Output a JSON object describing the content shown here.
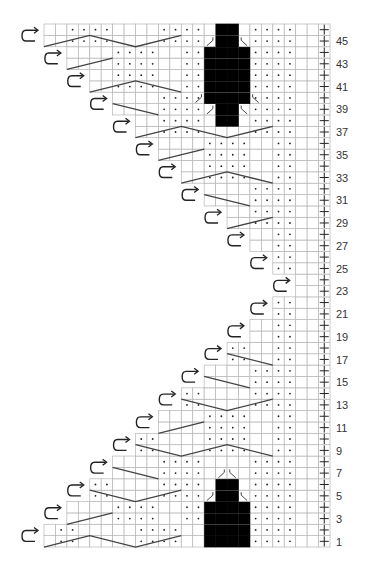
{
  "grid": {
    "x0": 44,
    "y0": 24,
    "cell_w": 11.44,
    "cell_h": 11.37,
    "cols": 25,
    "rows": 46,
    "grid_color": "#b5b5b5",
    "line_color": "#444444",
    "fill_color": "#000000"
  },
  "legend_symbols": {
    "dot": "purl stitch",
    "plus_column": "edge stitch",
    "turn_arrow": "turn (short row)",
    "black": "no stitch",
    "diagonal_line": "cable / crossing line",
    "y_symbol": "increase"
  },
  "row_labels": [
    "1",
    "3",
    "5",
    "7",
    "9",
    "11",
    "13",
    "15",
    "17",
    "19",
    "21",
    "23",
    "25",
    "27",
    "29",
    "31",
    "33",
    "35",
    "37",
    "39",
    "41",
    "43",
    "45"
  ],
  "rows": [
    {
      "n": 1,
      "start": 0,
      "dots": [
        1,
        2,
        8,
        9,
        10,
        11,
        15,
        16,
        18,
        19,
        20,
        21
      ],
      "black": [
        14,
        15,
        16,
        17
      ],
      "line": [
        [
          0,
          1
        ],
        [
          4,
          0
        ],
        [
          8,
          1
        ],
        [
          12,
          0
        ]
      ]
    },
    {
      "n": 2,
      "start": 0,
      "dots": [
        1,
        2,
        8,
        9,
        10,
        11,
        15,
        16,
        18,
        19,
        20,
        21
      ],
      "black": [
        14,
        15,
        16,
        17
      ]
    },
    {
      "n": 3,
      "start": 2,
      "dots": [
        6,
        7,
        8,
        9,
        12,
        13,
        18,
        19,
        20,
        21
      ],
      "black": [
        14,
        15,
        16,
        17
      ],
      "line": [
        [
          2,
          1
        ],
        [
          6,
          0
        ]
      ]
    },
    {
      "n": 4,
      "start": 2,
      "dots": [
        6,
        7,
        8,
        9,
        12,
        13,
        18,
        19,
        20,
        21
      ],
      "black": [
        14,
        15,
        16,
        17
      ]
    },
    {
      "n": 5,
      "start": 4,
      "dots": [
        4,
        5,
        10,
        11,
        12,
        13,
        18,
        19,
        20,
        21
      ],
      "black": [
        15,
        16
      ],
      "y": [
        14,
        17
      ],
      "line": [
        [
          4,
          0
        ],
        [
          8,
          1
        ],
        [
          12,
          0
        ]
      ]
    },
    {
      "n": 6,
      "start": 4,
      "dots": [
        4,
        5,
        10,
        11,
        12,
        13,
        18,
        19,
        20,
        21
      ],
      "black": [
        15,
        16
      ]
    },
    {
      "n": 7,
      "start": 6,
      "dots": [
        10,
        11,
        12,
        13,
        18,
        19,
        20,
        21
      ],
      "y": [
        15,
        16
      ],
      "line": [
        [
          6,
          0
        ],
        [
          10,
          1
        ]
      ]
    },
    {
      "n": 8,
      "start": 6,
      "dots": [
        10,
        11,
        12,
        13,
        18,
        19,
        20,
        21
      ]
    },
    {
      "n": 9,
      "start": 8,
      "dots": [
        8,
        9,
        14,
        15,
        16,
        17,
        20,
        21
      ],
      "line": [
        [
          8,
          0
        ],
        [
          12,
          1
        ],
        [
          16,
          0
        ],
        [
          20,
          1
        ]
      ]
    },
    {
      "n": 10,
      "start": 8,
      "dots": [
        8,
        9,
        14,
        15,
        16,
        17,
        20,
        21
      ]
    },
    {
      "n": 11,
      "start": 10,
      "dots": [
        14,
        15,
        16,
        17,
        20,
        21
      ],
      "line": [
        [
          10,
          1
        ],
        [
          14,
          0
        ]
      ]
    },
    {
      "n": 12,
      "start": 10,
      "dots": [
        14,
        15,
        16,
        17,
        20,
        21
      ]
    },
    {
      "n": 13,
      "start": 12,
      "dots": [
        12,
        13,
        18,
        19,
        20,
        21
      ],
      "line": [
        [
          12,
          0
        ],
        [
          16,
          1
        ],
        [
          20,
          0
        ]
      ]
    },
    {
      "n": 14,
      "start": 12,
      "dots": [
        12,
        13,
        18,
        19,
        20,
        21
      ]
    },
    {
      "n": 15,
      "start": 14,
      "dots": [
        18,
        19,
        20,
        21
      ],
      "line": [
        [
          14,
          0
        ],
        [
          18,
          1
        ]
      ]
    },
    {
      "n": 16,
      "start": 14,
      "dots": [
        18,
        19,
        20,
        21
      ]
    },
    {
      "n": 17,
      "start": 16,
      "dots": [
        16,
        17,
        20,
        21
      ],
      "line": [
        [
          16,
          0
        ],
        [
          20,
          1
        ]
      ]
    },
    {
      "n": 18,
      "start": 16,
      "dots": [
        16,
        17,
        20,
        21
      ]
    },
    {
      "n": 19,
      "start": 18,
      "dots": [
        20,
        21
      ]
    },
    {
      "n": 20,
      "start": 18,
      "dots": [
        20,
        21
      ]
    },
    {
      "n": 21,
      "start": 20,
      "dots": [
        20,
        21
      ]
    },
    {
      "n": 22,
      "start": 20,
      "dots": [
        20,
        21
      ]
    },
    {
      "n": 23,
      "start": 22,
      "dots": []
    },
    {
      "n": 24,
      "start": 22,
      "dots": []
    },
    {
      "n": 25,
      "start": 20,
      "dots": [
        20,
        21
      ]
    },
    {
      "n": 26,
      "start": 20,
      "dots": [
        20,
        21
      ]
    },
    {
      "n": 27,
      "start": 18,
      "dots": [
        20,
        21
      ]
    },
    {
      "n": 28,
      "start": 18,
      "dots": [
        20,
        21
      ]
    },
    {
      "n": 29,
      "start": 16,
      "dots": [
        18,
        19,
        20,
        21
      ],
      "line": [
        [
          16,
          1
        ],
        [
          20,
          0
        ]
      ]
    },
    {
      "n": 30,
      "start": 16,
      "dots": [
        18,
        19,
        20,
        21
      ]
    },
    {
      "n": 31,
      "start": 14,
      "dots": [
        18,
        19,
        20,
        21
      ],
      "line": [
        [
          14,
          0
        ],
        [
          18,
          1
        ]
      ]
    },
    {
      "n": 32,
      "start": 14,
      "dots": [
        18,
        19,
        20,
        21
      ]
    },
    {
      "n": 33,
      "start": 12,
      "dots": [
        14,
        15,
        16,
        17,
        20,
        21
      ],
      "line": [
        [
          12,
          1
        ],
        [
          16,
          0
        ],
        [
          20,
          1
        ]
      ]
    },
    {
      "n": 34,
      "start": 12,
      "dots": [
        14,
        15,
        16,
        17,
        20,
        21
      ]
    },
    {
      "n": 35,
      "start": 10,
      "dots": [
        14,
        15,
        16,
        17,
        20,
        21
      ],
      "line": [
        [
          10,
          1
        ],
        [
          14,
          0
        ]
      ]
    },
    {
      "n": 36,
      "start": 10,
      "dots": [
        14,
        15,
        16,
        17,
        20,
        21
      ]
    },
    {
      "n": 37,
      "start": 8,
      "dots": [
        10,
        11,
        12,
        13,
        18,
        19,
        20,
        21
      ],
      "line": [
        [
          8,
          1
        ],
        [
          12,
          0
        ],
        [
          16,
          1
        ],
        [
          20,
          0
        ]
      ]
    },
    {
      "n": 38,
      "start": 8,
      "dots": [
        10,
        11,
        12,
        13,
        18,
        19,
        20,
        21
      ],
      "black": [
        15,
        16
      ]
    },
    {
      "n": 39,
      "start": 6,
      "dots": [
        10,
        11,
        12,
        13,
        18,
        19,
        20,
        21
      ],
      "black": [
        15,
        16
      ],
      "y": [
        14,
        17
      ],
      "line": [
        [
          6,
          0
        ],
        [
          10,
          1
        ]
      ]
    },
    {
      "n": 40,
      "start": 6,
      "dots": [
        10,
        11,
        12,
        13,
        18,
        19,
        20,
        21
      ],
      "black": [
        14,
        15,
        16,
        17
      ],
      "y": [
        13,
        18
      ]
    },
    {
      "n": 41,
      "start": 4,
      "dots": [
        6,
        7,
        8,
        9,
        12,
        13,
        18,
        19,
        20,
        21
      ],
      "black": [
        14,
        15,
        16,
        17
      ],
      "line": [
        [
          4,
          1
        ],
        [
          8,
          0
        ],
        [
          12,
          1
        ]
      ]
    },
    {
      "n": 42,
      "start": 4,
      "dots": [
        6,
        7,
        8,
        9,
        12,
        13,
        18,
        19,
        20,
        21
      ],
      "black": [
        14,
        15,
        16,
        17
      ]
    },
    {
      "n": 43,
      "start": 2,
      "dots": [
        6,
        7,
        8,
        9,
        12,
        13,
        18,
        19,
        20,
        21
      ],
      "black": [
        14,
        15,
        16,
        17
      ],
      "line": [
        [
          2,
          1
        ],
        [
          6,
          0
        ]
      ]
    },
    {
      "n": 44,
      "start": 2,
      "dots": [
        6,
        7,
        8,
        9,
        12,
        13,
        18,
        19,
        20,
        21
      ],
      "black": [
        14,
        15,
        16,
        17
      ]
    },
    {
      "n": 45,
      "start": 0,
      "dots": [
        2,
        3,
        4,
        5,
        10,
        11,
        12,
        13,
        18,
        19,
        20,
        21
      ],
      "black": [
        15,
        16
      ],
      "y": [
        14,
        17
      ],
      "line": [
        [
          0,
          1
        ],
        [
          4,
          0
        ],
        [
          8,
          1
        ],
        [
          12,
          0
        ]
      ]
    },
    {
      "n": 46,
      "start": 0,
      "dots": [
        2,
        3,
        4,
        5,
        10,
        11,
        12,
        13,
        18,
        19,
        20,
        21
      ],
      "black": [
        15,
        16
      ]
    }
  ]
}
